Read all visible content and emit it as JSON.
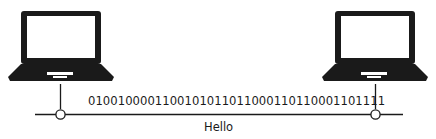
{
  "diagram": {
    "nodes": [
      {
        "id": "left-laptop",
        "type": "laptop-icon"
      },
      {
        "id": "right-laptop",
        "type": "laptop-icon"
      }
    ],
    "link": {
      "binary": "0100100001100101011011000110110001101111",
      "decoded_label": "Hello"
    },
    "colors": {
      "stroke": "#1a1a1a",
      "background": "#ffffff"
    }
  }
}
